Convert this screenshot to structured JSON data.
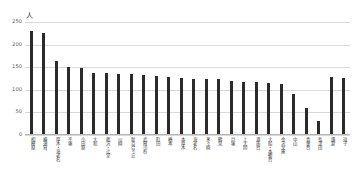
{
  "chart_data": {
    "type": "bar",
    "title": "",
    "xlabel": "",
    "ylabel": "人",
    "ylim": [
      0,
      250
    ],
    "yticks": [
      0,
      50,
      100,
      150,
      200,
      250
    ],
    "grid": true,
    "legend": null,
    "bar_color": "#2b2b2b",
    "grid_color": "#d9d9d9",
    "categories": [
      "相模原",
      "横須賀",
      "厚木・海老名",
      "平塚",
      "小田原",
      "大和",
      "藤沢・辻堂",
      "川崎",
      "新百合ヶ丘",
      "武蔵小杉",
      "町田",
      "橋本",
      "本厚木",
      "海老名",
      "茅ヶ崎",
      "鶴見",
      "戸塚",
      "上大岡",
      "港南台",
      "大船・本郷台",
      "金沢文庫",
      "中山",
      "青葉台",
      "長津田",
      "鎌倉",
      "逗子"
    ],
    "values": [
      230,
      225,
      163,
      150,
      149,
      138,
      137,
      135,
      134,
      132,
      130,
      128,
      126,
      125,
      125,
      125,
      120,
      118,
      118,
      115,
      112,
      90,
      60,
      30,
      128,
      126
    ]
  },
  "axis": {
    "unit_label": "人"
  }
}
